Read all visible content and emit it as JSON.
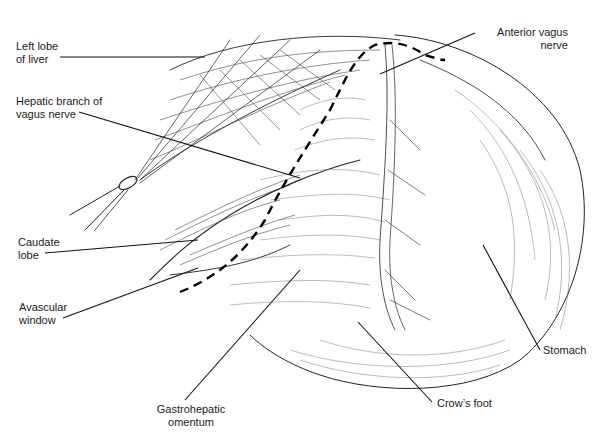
{
  "figure": {
    "type": "anatomical line illustration",
    "labels": {
      "left_lobe_liver": [
        "Left lobe",
        "of liver"
      ],
      "hepatic_branch": [
        "Hepatic branch of",
        "vagus nerve"
      ],
      "caudate_lobe": [
        "Caudate",
        "lobe"
      ],
      "avascular_window": [
        "Avascular",
        "window"
      ],
      "gastrohepatic_omentum": [
        "Gastrohepatic",
        "omentum"
      ],
      "crows_foot": [
        "Crow’s foot"
      ],
      "stomach": [
        "Stomach"
      ],
      "anterior_vagus": [
        "Anterior vagus",
        "nerve"
      ]
    },
    "colors": {
      "ink": "#222222",
      "background": "#ffffff"
    }
  }
}
